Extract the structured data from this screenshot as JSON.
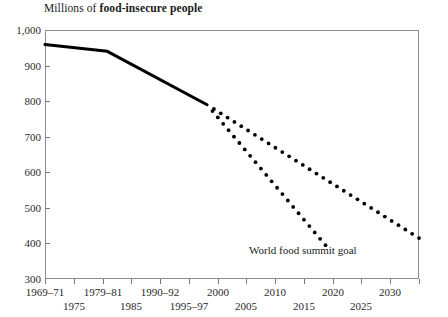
{
  "chart_data": {
    "type": "line",
    "title": "Millions of food-insecure people",
    "title_normal": "Millions of ",
    "title_bold": "food-insecure people",
    "xlabel": "",
    "ylabel": "",
    "ylim": [
      300,
      1000
    ],
    "ytick_values": [
      1000,
      900,
      800,
      700,
      600,
      500,
      400,
      300
    ],
    "ytick_labels": [
      "1,000",
      "900",
      "800",
      "700",
      "600",
      "500",
      "400",
      "300"
    ],
    "grid": false,
    "legend": "none",
    "x_categories_upper": [
      "1969–71",
      "1979–81",
      "1990–92",
      "2000",
      "2010",
      "2020",
      "2030"
    ],
    "x_categories_lower": [
      "1975",
      "1985",
      "1995–97",
      "2005",
      "2015",
      "2025"
    ],
    "xlim_years": [
      1970,
      2030
    ],
    "series": [
      {
        "name": "Historical food-insecure people",
        "style": "solid",
        "color": "#000000",
        "x": [
          1970,
          1980,
          1996
        ],
        "values": [
          959,
          940,
          790
        ]
      },
      {
        "name": "Projected trend",
        "style": "dotted",
        "color": "#000000",
        "x": [
          1996,
          2030
        ],
        "values": [
          790,
          415
        ]
      },
      {
        "name": "World food summit goal",
        "style": "dotted",
        "color": "#000000",
        "x": [
          1996,
          2015
        ],
        "values": [
          790,
          395
        ]
      }
    ],
    "annotations": [
      {
        "text": "World food summit goal",
        "x": 2012,
        "y": 345
      }
    ]
  }
}
